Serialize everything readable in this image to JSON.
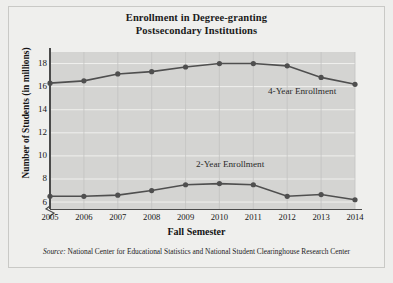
{
  "title": {
    "line1": "Enrollment in Degree-granting",
    "line2": "Postsecondary Institutions"
  },
  "axes": {
    "x_label": "Fall Semester",
    "y_label": "Number of Students (in millions)",
    "y_ticks": [
      "6",
      "8",
      "10",
      "12",
      "14",
      "16",
      "18"
    ],
    "x_ticks": [
      "2005",
      "2006",
      "2007",
      "2008",
      "2009",
      "2010",
      "2011",
      "2012",
      "2013",
      "2014"
    ]
  },
  "annotations": {
    "four_year": "4-Year Enrollment",
    "two_year": "2-Year Enrollment"
  },
  "source": {
    "label": "Source:",
    "text": " National Center for Educational Statistics and National Student Clearinghouse Research Center"
  },
  "colors": {
    "plot_background": "#d4d4d2",
    "figure_background": "#efefed",
    "series_line": "#4f4f4f",
    "gridline": "#f0f0ee",
    "axis": "#4a4a4a",
    "text": "#161616"
  },
  "chart_data": {
    "type": "line",
    "title": "Enrollment in Degree-granting Postsecondary Institutions",
    "xlabel": "Fall Semester",
    "ylabel": "Number of Students (in millions)",
    "x": [
      2005,
      2006,
      2007,
      2008,
      2009,
      2010,
      2011,
      2012,
      2013,
      2014
    ],
    "categories": [
      "2005",
      "2006",
      "2007",
      "2008",
      "2009",
      "2010",
      "2011",
      "2012",
      "2013",
      "2014"
    ],
    "series": [
      {
        "name": "4-Year Enrollment",
        "values": [
          16.3,
          16.5,
          17.1,
          17.3,
          17.7,
          18.0,
          18.0,
          17.8,
          16.8,
          16.2
        ]
      },
      {
        "name": "2-Year Enrollment",
        "values": [
          6.5,
          6.5,
          6.6,
          7.0,
          7.5,
          7.6,
          7.5,
          6.5,
          6.65,
          6.2
        ]
      }
    ],
    "ylim": [
      5.4,
      19.0
    ],
    "xlim": [
      2005,
      2014
    ],
    "y_ticks": [
      6,
      8,
      10,
      12,
      14,
      16,
      18
    ],
    "grid": true,
    "y_axis_break": true,
    "legend": "inline-annotations",
    "marker": "filled-circle",
    "source": "Source: National Center for Educational Statistics and National Student Clearinghouse Research Center"
  }
}
